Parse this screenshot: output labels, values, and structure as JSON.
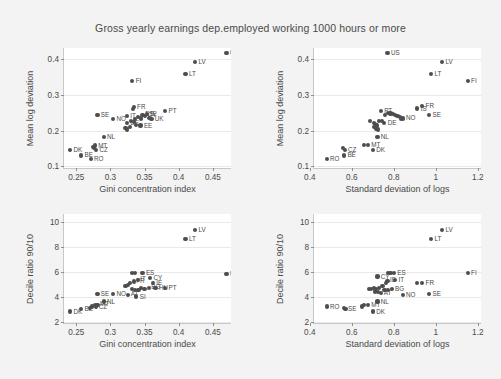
{
  "chart_data": [
    {
      "panel_id": "top-left",
      "type": "scatter",
      "title": "Gross yearly earnings dep.employed working 1000 hours or more",
      "xlabel": "Gini concentration index",
      "ylabel": "Mean log deviation",
      "xlim": [
        0.232,
        0.478
      ],
      "ylim": [
        0.092,
        0.432
      ],
      "xticks": [
        "0.25",
        "0.3",
        "0.35",
        "0.4",
        "0.45"
      ],
      "xtickvals": [
        0.25,
        0.3,
        0.35,
        0.4,
        0.45
      ],
      "yticks": [
        "0.1",
        "0.2",
        "0.3",
        "0.4"
      ],
      "ytickvals": [
        0.1,
        0.2,
        0.3,
        0.4
      ],
      "grid": "horizontal",
      "legend": "none",
      "points": [
        {
          "label": "US",
          "x": 0.47,
          "y": 0.418,
          "lp": "r"
        },
        {
          "label": "LV",
          "x": 0.424,
          "y": 0.393,
          "lp": "r"
        },
        {
          "label": "LT",
          "x": 0.41,
          "y": 0.359,
          "lp": "r"
        },
        {
          "label": "FI",
          "x": 0.332,
          "y": 0.339,
          "lp": "r"
        },
        {
          "label": "PT",
          "x": 0.38,
          "y": 0.254,
          "lp": "r"
        },
        {
          "label": "FR",
          "x": 0.334,
          "y": 0.266,
          "lp": "r"
        },
        {
          "label": "",
          "x": 0.333,
          "y": 0.26,
          "lp": "n"
        },
        {
          "label": "SE",
          "x": 0.281,
          "y": 0.243,
          "lp": "r"
        },
        {
          "label": "NO",
          "x": 0.304,
          "y": 0.233,
          "lp": "r"
        },
        {
          "label": "IE",
          "x": 0.354,
          "y": 0.246,
          "lp": "r"
        },
        {
          "label": "ES",
          "x": 0.347,
          "y": 0.244,
          "lp": "n"
        },
        {
          "label": "CY",
          "x": 0.351,
          "y": 0.241,
          "lp": "n"
        },
        {
          "label": "IT",
          "x": 0.324,
          "y": 0.242,
          "lp": "r"
        },
        {
          "label": "UK",
          "x": 0.36,
          "y": 0.232,
          "lp": "r"
        },
        {
          "label": "",
          "x": 0.357,
          "y": 0.236,
          "lp": "n"
        },
        {
          "label": "",
          "x": 0.345,
          "y": 0.234,
          "lp": "n"
        },
        {
          "label": "",
          "x": 0.34,
          "y": 0.238,
          "lp": "n"
        },
        {
          "label": "",
          "x": 0.336,
          "y": 0.232,
          "lp": "n"
        },
        {
          "label": "DE",
          "x": 0.324,
          "y": 0.221,
          "lp": "r"
        },
        {
          "label": "",
          "x": 0.33,
          "y": 0.226,
          "lp": "n"
        },
        {
          "label": "",
          "x": 0.334,
          "y": 0.223,
          "lp": "n"
        },
        {
          "label": "EE",
          "x": 0.344,
          "y": 0.214,
          "lp": "r"
        },
        {
          "label": "",
          "x": 0.338,
          "y": 0.216,
          "lp": "n"
        },
        {
          "label": "",
          "x": 0.329,
          "y": 0.211,
          "lp": "n"
        },
        {
          "label": "",
          "x": 0.322,
          "y": 0.207,
          "lp": "n"
        },
        {
          "label": "",
          "x": 0.324,
          "y": 0.203,
          "lp": "n"
        },
        {
          "label": "NL",
          "x": 0.29,
          "y": 0.183,
          "lp": "r"
        },
        {
          "label": "MT",
          "x": 0.277,
          "y": 0.158,
          "lp": "r"
        },
        {
          "label": "",
          "x": 0.274,
          "y": 0.154,
          "lp": "n"
        },
        {
          "label": "",
          "x": 0.276,
          "y": 0.15,
          "lp": "n"
        },
        {
          "label": "CZ",
          "x": 0.279,
          "y": 0.146,
          "lp": "r"
        },
        {
          "label": "DK",
          "x": 0.241,
          "y": 0.145,
          "lp": "r"
        },
        {
          "label": "BE",
          "x": 0.257,
          "y": 0.13,
          "lp": "r"
        },
        {
          "label": "RO",
          "x": 0.271,
          "y": 0.12,
          "lp": "r"
        }
      ]
    },
    {
      "panel_id": "top-right",
      "type": "scatter",
      "xlabel": "Standard deviation of logs",
      "ylabel": "Mean log deviation",
      "xlim": [
        0.42,
        1.22
      ],
      "ylim": [
        0.092,
        0.432
      ],
      "xticks": [
        "0.4",
        "0.6",
        "0.8",
        "1",
        "1.2"
      ],
      "xtickvals": [
        0.4,
        0.6,
        0.8,
        1.0,
        1.2
      ],
      "yticks": [
        "0.1",
        "0.2",
        "0.3",
        "0.4"
      ],
      "ytickvals": [
        0.1,
        0.2,
        0.3,
        0.4
      ],
      "grid": "horizontal",
      "legend": "none",
      "points": [
        {
          "label": "US",
          "x": 0.77,
          "y": 0.418,
          "lp": "r"
        },
        {
          "label": "LV",
          "x": 1.03,
          "y": 0.393,
          "lp": "r"
        },
        {
          "label": "LT",
          "x": 0.978,
          "y": 0.359,
          "lp": "r"
        },
        {
          "label": "FI",
          "x": 1.152,
          "y": 0.339,
          "lp": "r"
        },
        {
          "label": "FR",
          "x": 0.935,
          "y": 0.27,
          "lp": "r"
        },
        {
          "label": "IS",
          "x": 0.912,
          "y": 0.262,
          "lp": "r"
        },
        {
          "label": "SE",
          "x": 0.968,
          "y": 0.244,
          "lp": "r"
        },
        {
          "label": "PT",
          "x": 0.738,
          "y": 0.256,
          "lp": "r"
        },
        {
          "label": "NO",
          "x": 0.842,
          "y": 0.234,
          "lp": "r"
        },
        {
          "label": "",
          "x": 0.772,
          "y": 0.25,
          "lp": "n"
        },
        {
          "label": "",
          "x": 0.784,
          "y": 0.248,
          "lp": "n"
        },
        {
          "label": "",
          "x": 0.796,
          "y": 0.246,
          "lp": "n"
        },
        {
          "label": "",
          "x": 0.806,
          "y": 0.244,
          "lp": "n"
        },
        {
          "label": "",
          "x": 0.818,
          "y": 0.241,
          "lp": "n"
        },
        {
          "label": "",
          "x": 0.76,
          "y": 0.244,
          "lp": "n"
        },
        {
          "label": "",
          "x": 0.828,
          "y": 0.238,
          "lp": "n"
        },
        {
          "label": "",
          "x": 0.836,
          "y": 0.234,
          "lp": "n"
        },
        {
          "label": "DE",
          "x": 0.755,
          "y": 0.221,
          "lp": "r"
        },
        {
          "label": "",
          "x": 0.742,
          "y": 0.226,
          "lp": "n"
        },
        {
          "label": "",
          "x": 0.728,
          "y": 0.228,
          "lp": "n"
        },
        {
          "label": "",
          "x": 0.688,
          "y": 0.228,
          "lp": "n"
        },
        {
          "label": "",
          "x": 0.704,
          "y": 0.222,
          "lp": "n"
        },
        {
          "label": "",
          "x": 0.712,
          "y": 0.218,
          "lp": "n"
        },
        {
          "label": "",
          "x": 0.72,
          "y": 0.214,
          "lp": "n"
        },
        {
          "label": "",
          "x": 0.706,
          "y": 0.21,
          "lp": "n"
        },
        {
          "label": "",
          "x": 0.716,
          "y": 0.206,
          "lp": "n"
        },
        {
          "label": "",
          "x": 0.726,
          "y": 0.203,
          "lp": "n"
        },
        {
          "label": "NL",
          "x": 0.722,
          "y": 0.183,
          "lp": "r"
        },
        {
          "label": "MT",
          "x": 0.676,
          "y": 0.16,
          "lp": "r"
        },
        {
          "label": "",
          "x": 0.66,
          "y": 0.16,
          "lp": "n"
        },
        {
          "label": "CZ",
          "x": 0.566,
          "y": 0.146,
          "lp": "r"
        },
        {
          "label": "",
          "x": 0.56,
          "y": 0.152,
          "lp": "n"
        },
        {
          "label": "DK",
          "x": 0.7,
          "y": 0.146,
          "lp": "r"
        },
        {
          "label": "BE",
          "x": 0.563,
          "y": 0.13,
          "lp": "r"
        },
        {
          "label": "RO",
          "x": 0.48,
          "y": 0.12,
          "lp": "r"
        }
      ]
    },
    {
      "panel_id": "bottom-left",
      "type": "scatter",
      "xlabel": "Gini concentration index",
      "ylabel": "Decile ratio 90/10",
      "xlim": [
        0.232,
        0.478
      ],
      "ylim": [
        1.8,
        10.6
      ],
      "xticks": [
        "0.25",
        "0.3",
        "0.35",
        "0.4",
        "0.45"
      ],
      "xtickvals": [
        0.25,
        0.3,
        0.35,
        0.4,
        0.45
      ],
      "yticks": [
        "2",
        "4",
        "6",
        "8",
        "10"
      ],
      "ytickvals": [
        2,
        4,
        6,
        8,
        10
      ],
      "grid": "horizontal",
      "legend": "none",
      "points": [
        {
          "label": "LV",
          "x": 0.424,
          "y": 9.3,
          "lp": "r"
        },
        {
          "label": "LT",
          "x": 0.41,
          "y": 8.6,
          "lp": "r"
        },
        {
          "label": "US",
          "x": 0.47,
          "y": 5.8,
          "lp": "r"
        },
        {
          "label": "ES",
          "x": 0.347,
          "y": 5.9,
          "lp": "r"
        },
        {
          "label": "",
          "x": 0.336,
          "y": 5.9,
          "lp": "n"
        },
        {
          "label": "",
          "x": 0.331,
          "y": 5.85,
          "lp": "n"
        },
        {
          "label": "CY",
          "x": 0.358,
          "y": 5.45,
          "lp": "r"
        },
        {
          "label": "IE",
          "x": 0.362,
          "y": 5.1,
          "lp": "r"
        },
        {
          "label": "IT",
          "x": 0.34,
          "y": 5.35,
          "lp": "n"
        },
        {
          "label": "FR",
          "x": 0.334,
          "y": 5.2,
          "lp": "n"
        },
        {
          "label": "",
          "x": 0.329,
          "y": 5.1,
          "lp": "n"
        },
        {
          "label": "",
          "x": 0.326,
          "y": 4.95,
          "lp": "n"
        },
        {
          "label": "",
          "x": 0.322,
          "y": 4.85,
          "lp": "n"
        },
        {
          "label": "BG",
          "x": 0.356,
          "y": 4.7,
          "lp": "n"
        },
        {
          "label": "HU",
          "x": 0.366,
          "y": 4.65,
          "lp": "r"
        },
        {
          "label": "PT",
          "x": 0.38,
          "y": 4.65,
          "lp": "r"
        },
        {
          "label": "",
          "x": 0.35,
          "y": 4.6,
          "lp": "n"
        },
        {
          "label": "",
          "x": 0.345,
          "y": 4.7,
          "lp": "n"
        },
        {
          "label": "",
          "x": 0.341,
          "y": 4.55,
          "lp": "n"
        },
        {
          "label": "",
          "x": 0.336,
          "y": 4.5,
          "lp": "n"
        },
        {
          "label": "",
          "x": 0.331,
          "y": 4.6,
          "lp": "n"
        },
        {
          "label": "AT",
          "x": 0.326,
          "y": 4.15,
          "lp": "n"
        },
        {
          "label": "SI",
          "x": 0.338,
          "y": 4.0,
          "lp": "r"
        },
        {
          "label": "NO",
          "x": 0.304,
          "y": 4.2,
          "lp": "r"
        },
        {
          "label": "SE",
          "x": 0.281,
          "y": 4.2,
          "lp": "r"
        },
        {
          "label": "NL",
          "x": 0.29,
          "y": 3.6,
          "lp": "r"
        },
        {
          "label": "MT",
          "x": 0.281,
          "y": 3.35,
          "lp": "n"
        },
        {
          "label": "",
          "x": 0.277,
          "y": 3.3,
          "lp": "n"
        },
        {
          "label": "CZ",
          "x": 0.279,
          "y": 3.15,
          "lp": "n"
        },
        {
          "label": "",
          "x": 0.273,
          "y": 3.2,
          "lp": "n"
        },
        {
          "label": "",
          "x": 0.27,
          "y": 3.1,
          "lp": "n"
        },
        {
          "label": "BE",
          "x": 0.257,
          "y": 3.0,
          "lp": "r"
        },
        {
          "label": "DK",
          "x": 0.241,
          "y": 2.8,
          "lp": "r"
        }
      ]
    },
    {
      "panel_id": "bottom-right",
      "type": "scatter",
      "xlabel": "Standard deviation of logs",
      "ylabel": "Decile ratio 90/10",
      "xlim": [
        0.42,
        1.22
      ],
      "ylim": [
        1.8,
        10.6
      ],
      "xticks": [
        "0.4",
        "0.6",
        "0.8",
        "1",
        "1.2"
      ],
      "xtickvals": [
        0.4,
        0.6,
        0.8,
        1.0,
        1.2
      ],
      "yticks": [
        "2",
        "4",
        "6",
        "8",
        "10"
      ],
      "ytickvals": [
        2,
        4,
        6,
        8,
        10
      ],
      "grid": "horizontal",
      "legend": "none",
      "points": [
        {
          "label": "LV",
          "x": 1.03,
          "y": 9.3,
          "lp": "r"
        },
        {
          "label": "LT",
          "x": 0.978,
          "y": 8.6,
          "lp": "r"
        },
        {
          "label": "FI",
          "x": 1.152,
          "y": 5.9,
          "lp": "r"
        },
        {
          "label": "ES",
          "x": 0.8,
          "y": 5.9,
          "lp": "r"
        },
        {
          "label": "",
          "x": 0.784,
          "y": 5.9,
          "lp": "n"
        },
        {
          "label": "",
          "x": 0.772,
          "y": 5.85,
          "lp": "n"
        },
        {
          "label": "CY",
          "x": 0.722,
          "y": 5.6,
          "lp": "r"
        },
        {
          "label": "IT",
          "x": 0.806,
          "y": 5.35,
          "lp": "r"
        },
        {
          "label": "IE",
          "x": 0.77,
          "y": 5.25,
          "lp": "n"
        },
        {
          "label": "FR",
          "x": 0.935,
          "y": 5.1,
          "lp": "r"
        },
        {
          "label": "",
          "x": 0.912,
          "y": 5.1,
          "lp": "n"
        },
        {
          "label": "",
          "x": 0.762,
          "y": 5.05,
          "lp": "n"
        },
        {
          "label": "BG",
          "x": 0.79,
          "y": 4.6,
          "lp": "r"
        },
        {
          "label": "NO",
          "x": 0.842,
          "y": 4.15,
          "lp": "r"
        },
        {
          "label": "SE",
          "x": 0.968,
          "y": 4.2,
          "lp": "r"
        },
        {
          "label": "",
          "x": 0.746,
          "y": 4.85,
          "lp": "n"
        },
        {
          "label": "",
          "x": 0.73,
          "y": 4.7,
          "lp": "n"
        },
        {
          "label": "",
          "x": 0.716,
          "y": 4.6,
          "lp": "n"
        },
        {
          "label": "",
          "x": 0.704,
          "y": 4.65,
          "lp": "n"
        },
        {
          "label": "",
          "x": 0.692,
          "y": 4.6,
          "lp": "n"
        },
        {
          "label": "",
          "x": 0.68,
          "y": 4.6,
          "lp": "n"
        },
        {
          "label": "",
          "x": 0.756,
          "y": 4.55,
          "lp": "n"
        },
        {
          "label": "",
          "x": 0.772,
          "y": 4.5,
          "lp": "n"
        },
        {
          "label": "AT",
          "x": 0.74,
          "y": 4.25,
          "lp": "n"
        },
        {
          "label": "",
          "x": 0.724,
          "y": 4.35,
          "lp": "n"
        },
        {
          "label": "",
          "x": 0.71,
          "y": 4.4,
          "lp": "n"
        },
        {
          "label": "NL",
          "x": 0.722,
          "y": 3.6,
          "lp": "r"
        },
        {
          "label": "MT",
          "x": 0.676,
          "y": 3.35,
          "lp": "r"
        },
        {
          "label": "",
          "x": 0.66,
          "y": 3.3,
          "lp": "n"
        },
        {
          "label": "",
          "x": 0.648,
          "y": 3.2,
          "lp": "n"
        },
        {
          "label": "SE2",
          "x": 0.57,
          "y": 3.0,
          "lp": "n"
        },
        {
          "label": "",
          "x": 0.562,
          "y": 3.05,
          "lp": "n"
        },
        {
          "label": "RO",
          "x": 0.48,
          "y": 3.2,
          "lp": "r"
        },
        {
          "label": "DK",
          "x": 0.7,
          "y": 2.8,
          "lp": "r"
        }
      ]
    }
  ],
  "figure": {
    "title": "Gross yearly earnings dep.employed working 1000 hours or more",
    "background_color": "#f3f3f3",
    "plot_background_color": "#ffffff",
    "point_color": "#4d4d4d",
    "axis_color": "#8f8f8f",
    "text_color": "#4a4a4a",
    "panel_count": 4
  }
}
